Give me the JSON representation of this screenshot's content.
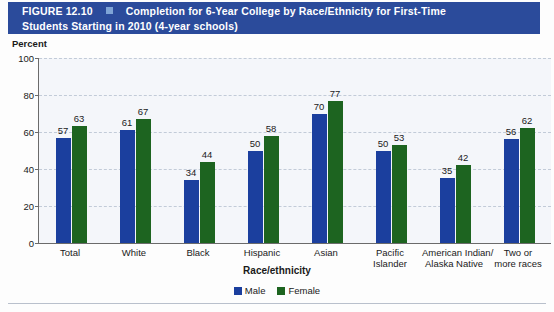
{
  "header": {
    "figure_number": "FIGURE 12.10",
    "bullet_icon": "square-bullet-icon",
    "title_line1": "Completion for 6-Year College by Race/Ethnicity for First-Time",
    "title_line2": "Students Starting in 2010 (4-year schools)",
    "background_color": "#2b4b9b",
    "text_color": "#ffffff"
  },
  "axis": {
    "y_axis_label": "Percent",
    "x_axis_title": "Race/ethnicity",
    "y_ticks": [
      "0",
      "20",
      "40",
      "60",
      "80",
      "100"
    ]
  },
  "legend": {
    "items": [
      {
        "label": "Male",
        "color": "#1b3f9e"
      },
      {
        "label": "Female",
        "color": "#1d6420"
      }
    ]
  },
  "chart_data": {
    "type": "bar",
    "title": "Completion for 6-Year College by Race/Ethnicity for First-Time Students Starting in 2010 (4-year schools)",
    "xlabel": "Race/ethnicity",
    "ylabel": "Percent",
    "ylim": [
      0,
      100
    ],
    "yticks": [
      0,
      20,
      40,
      60,
      80,
      100
    ],
    "grid": true,
    "legend_position": "bottom-center",
    "categories": [
      "Total",
      "White",
      "Black",
      "Hispanic",
      "Asian",
      "Pacific Islander",
      "American Indian/ Alaska Native",
      "Two or more races"
    ],
    "category_lines": [
      [
        "Total"
      ],
      [
        "White"
      ],
      [
        "Black"
      ],
      [
        "Hispanic"
      ],
      [
        "Asian"
      ],
      [
        "Pacific",
        "Islander"
      ],
      [
        "American Indian/",
        "Alaska Native"
      ],
      [
        "Two or",
        "more races"
      ]
    ],
    "series": [
      {
        "name": "Male",
        "color": "#1b3f9e",
        "values": [
          57,
          61,
          34,
          50,
          70,
          50,
          35,
          56
        ]
      },
      {
        "name": "Female",
        "color": "#1d6420",
        "values": [
          63,
          67,
          44,
          58,
          77,
          53,
          42,
          62
        ]
      }
    ]
  }
}
